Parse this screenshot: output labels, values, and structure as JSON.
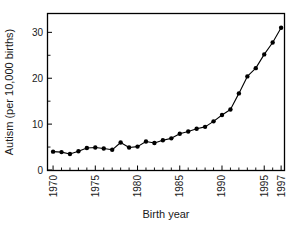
{
  "chart_data": {
    "type": "line",
    "title": "",
    "xlabel": "Birth year",
    "ylabel": "Autism (per 10,000 births)",
    "xlim": [
      1969.4,
      1997.4
    ],
    "ylim": [
      0,
      34
    ],
    "grid": false,
    "legend": null,
    "x": [
      1970,
      1971,
      1972,
      1973,
      1974,
      1975,
      1976,
      1977,
      1978,
      1979,
      1980,
      1981,
      1982,
      1983,
      1984,
      1985,
      1986,
      1987,
      1988,
      1989,
      1990,
      1991,
      1992,
      1993,
      1994,
      1995,
      1996,
      1997
    ],
    "values": [
      4.0,
      3.9,
      3.5,
      4.1,
      4.8,
      4.9,
      4.7,
      4.4,
      6.0,
      4.9,
      5.1,
      6.2,
      5.9,
      6.5,
      6.9,
      7.9,
      8.4,
      9.0,
      9.4,
      10.6,
      12.0,
      13.2,
      16.7,
      20.4,
      22.2,
      25.2,
      27.8,
      31.0
    ],
    "x_ticks_major": [
      1970,
      1975,
      1980,
      1985,
      1990,
      1995,
      1997
    ],
    "x_tick_labels": [
      "1970",
      "1975",
      "1980",
      "1985",
      "1990",
      "1995",
      "1997"
    ],
    "x_tick_label_rotation": -90,
    "y_ticks_major": [
      0,
      10,
      20,
      30
    ],
    "y_tick_labels": [
      "0",
      "10",
      "20",
      "30"
    ],
    "y_ticks_minor": [
      5,
      15,
      25
    ],
    "marker": "filled-circle",
    "line_color": "#000000",
    "marker_color": "#000000",
    "background_color": "#ffffff"
  }
}
